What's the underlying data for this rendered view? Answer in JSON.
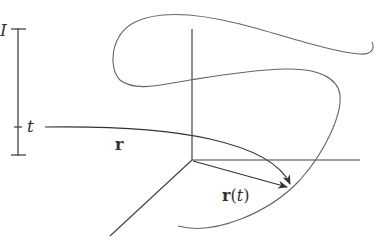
{
  "diagram": {
    "interval_label": "I",
    "parameter_label": "t",
    "map_label": "r",
    "vector_label_main": "r",
    "vector_label_open": "(",
    "vector_label_arg": "t",
    "vector_label_close": ")",
    "colors": {
      "line": "#444444",
      "curve": "#666666",
      "background": "#ffffff"
    }
  }
}
